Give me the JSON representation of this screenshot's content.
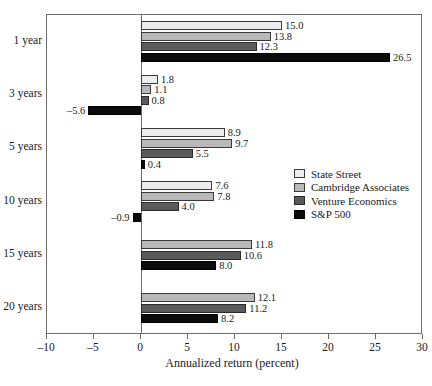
{
  "chart_data": {
    "type": "bar",
    "orientation": "horizontal",
    "title": "",
    "xlabel": "Annualized return (percent)",
    "ylabel": "",
    "categories": [
      "1 year",
      "3 years",
      "5 years",
      "10 years",
      "15 years",
      "20 years"
    ],
    "xlim": [
      -10,
      30
    ],
    "xticks": [
      -10,
      -5,
      0,
      5,
      10,
      15,
      20,
      25,
      30
    ],
    "xticklabels": [
      "–10",
      "–5",
      "0",
      "5",
      "10",
      "15",
      "20",
      "25",
      "30"
    ],
    "grid": false,
    "legend_position": "right-middle",
    "series": [
      {
        "name": "State Street",
        "color": "#ededed",
        "values": [
          15.0,
          1.8,
          8.9,
          7.6,
          null,
          null
        ]
      },
      {
        "name": "Cambridge Associates",
        "color": "#b9b9b9",
        "values": [
          13.8,
          1.1,
          9.7,
          7.8,
          11.8,
          12.1
        ]
      },
      {
        "name": "Venture Economics",
        "color": "#5a5a5a",
        "values": [
          12.3,
          0.8,
          5.5,
          4.0,
          10.6,
          11.2
        ]
      },
      {
        "name": "S&P 500",
        "color": "#0a0a0a",
        "values": [
          26.5,
          -5.6,
          0.4,
          -0.9,
          8.0,
          8.2
        ]
      }
    ],
    "data_labels": [
      [
        "15.0",
        "1.8",
        "8.9",
        "7.6",
        "",
        ""
      ],
      [
        "13.8",
        "1.1",
        "9.7",
        "7.8",
        "11.8",
        "12.1"
      ],
      [
        "12.3",
        "0.8",
        "5.5",
        "4.0",
        "10.6",
        "11.2"
      ],
      [
        "26.5",
        "–5.6",
        "0.4",
        "–0.9",
        "8.0",
        "8.2"
      ]
    ]
  }
}
